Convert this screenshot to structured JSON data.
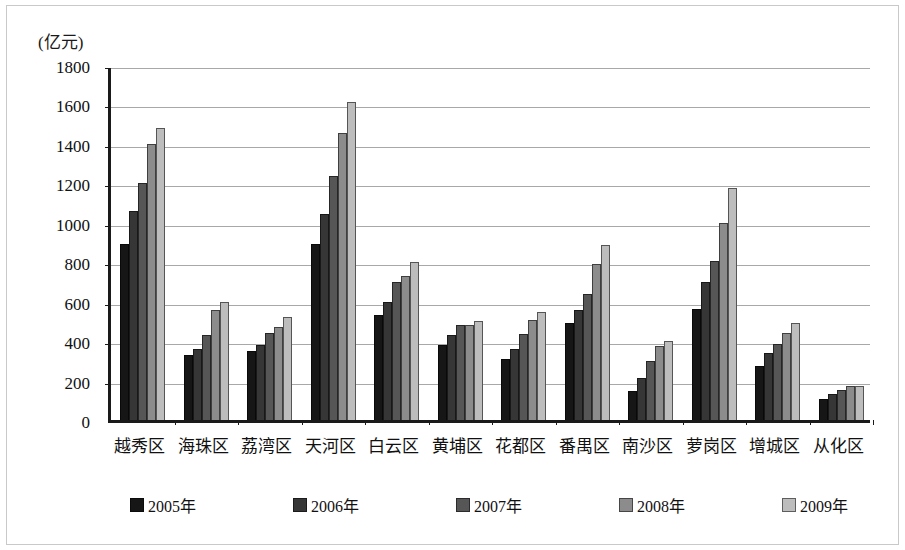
{
  "figure": {
    "unit_label": "(亿元)",
    "border_color": "#c9c9c9",
    "axis_color": "#1a1a1a",
    "grid_color": "#a8a8a8"
  },
  "chart_data": {
    "type": "bar",
    "title": "",
    "subtitle": "",
    "xlabel": "",
    "ylabel": "(亿元)",
    "ylim": [
      0,
      1800
    ],
    "ytick_step": 200,
    "yticks": [
      0,
      200,
      400,
      600,
      800,
      1000,
      1200,
      1400,
      1600,
      1800
    ],
    "ytick_labels": [
      "0",
      "200",
      "400",
      "600",
      "800",
      "1000",
      "1200",
      "1400",
      "1600",
      "1800"
    ],
    "grid": true,
    "grid_axis": "y",
    "legend_position": "bottom",
    "categories": [
      "越秀区",
      "海珠区",
      "荔湾区",
      "天河区",
      "白云区",
      "黄埔区",
      "花都区",
      "番禺区",
      "南沙区",
      "萝岗区",
      "增城区",
      "从化区"
    ],
    "series": [
      {
        "name": "2005年",
        "color": "#161616",
        "values": [
          890,
          330,
          350,
          890,
          535,
          380,
          310,
          490,
          145,
          565,
          275,
          105
        ]
      },
      {
        "name": "2006年",
        "color": "#363636",
        "values": [
          1060,
          360,
          380,
          1045,
          600,
          430,
          360,
          560,
          215,
          700,
          340,
          130
        ]
      },
      {
        "name": "2007年",
        "color": "#565656",
        "values": [
          1200,
          430,
          440,
          1235,
          700,
          480,
          435,
          640,
          300,
          805,
          385,
          150
        ]
      },
      {
        "name": "2008年",
        "color": "#8c8c8c",
        "values": [
          1400,
          560,
          470,
          1455,
          730,
          480,
          505,
          790,
          375,
          1000,
          440,
          170
        ]
      },
      {
        "name": "2009年",
        "color": "#bdbdbd",
        "values": [
          1480,
          600,
          520,
          1610,
          800,
          500,
          550,
          885,
          400,
          1175,
          490,
          175
        ]
      }
    ]
  }
}
